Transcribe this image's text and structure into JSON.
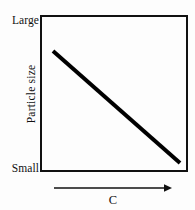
{
  "figure": {
    "background_color": "#fdfdfd",
    "ink_color": "#111111"
  },
  "axes": {
    "y": {
      "title": "Particle size",
      "tick_top_label": "Large",
      "tick_bottom_label": "Small",
      "orientation": "vertical",
      "title_rotation_deg": -90
    },
    "x": {
      "title": "C",
      "arrow_direction": "right",
      "arrow_icon": "arrow-right-icon",
      "tick_labels": []
    }
  },
  "chart_data": {
    "type": "line",
    "title": "",
    "subtitle": "",
    "xlabel": "C",
    "ylabel": "Particle size",
    "grid": false,
    "legend": null,
    "xlim": [
      0,
      1
    ],
    "ylim": [
      0,
      1
    ],
    "x_tick_labels": [],
    "y_tick_labels": [
      "Small",
      "Large"
    ],
    "annotations": [],
    "series": [
      {
        "name": "Particle size vs C",
        "style": "solid",
        "color": "#000000",
        "line_width_px": 4,
        "x": [
          0.09,
          1.0
        ],
        "y": [
          0.77,
          0.06
        ],
        "points_px": [
          {
            "x": 53,
            "y": 51
          },
          {
            "x": 180,
            "y": 163
          }
        ],
        "trend": "decreasing"
      }
    ]
  }
}
